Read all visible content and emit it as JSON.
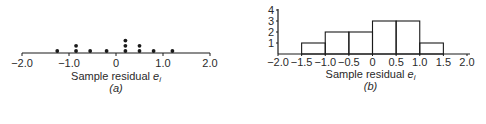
{
  "chart_data": [
    {
      "id": "a",
      "type": "scatter",
      "subtype": "dot-plot",
      "title": "",
      "xlabel": "Sample residual e_i",
      "xlabel_text": "Sample residual ",
      "xlabel_var": "e",
      "xlabel_sub": "i",
      "caption": "(a)",
      "xlim": [
        -2.0,
        2.0
      ],
      "xticks": [
        -2.0,
        -1.0,
        0,
        1.0,
        2.0
      ],
      "xtick_labels": [
        "−2.0",
        "−1.0",
        "0",
        "1.0",
        "2.0"
      ],
      "grid": false,
      "points": [
        {
          "x": -1.25,
          "count": 1
        },
        {
          "x": -0.85,
          "count": 2
        },
        {
          "x": -0.55,
          "count": 1
        },
        {
          "x": -0.2,
          "count": 1
        },
        {
          "x": 0.2,
          "count": 3
        },
        {
          "x": 0.5,
          "count": 2
        },
        {
          "x": 0.8,
          "count": 1
        },
        {
          "x": 1.2,
          "count": 1
        }
      ],
      "n": 12
    },
    {
      "id": "b",
      "type": "bar",
      "subtype": "histogram",
      "title": "",
      "xlabel": "Sample residual e_i",
      "xlabel_text": "Sample residual ",
      "xlabel_var": "e",
      "xlabel_sub": "i",
      "caption": "(b)",
      "ylabel": "",
      "xlim": [
        -2.0,
        2.0
      ],
      "ylim": [
        0,
        4
      ],
      "xticks": [
        -2.0,
        -1.5,
        -1.0,
        -0.5,
        0,
        0.5,
        1.0,
        1.5,
        2.0
      ],
      "xtick_labels": [
        "−2.0",
        "−1.5",
        "−1.0",
        "−0.5",
        "0",
        "0.5",
        "1.0",
        "1.5",
        "2.0"
      ],
      "yticks": [
        1,
        2,
        3,
        4
      ],
      "ytick_labels": [
        "1",
        "2",
        "3",
        "4"
      ],
      "grid": false,
      "bins": [
        {
          "from": -1.5,
          "to": -1.0,
          "count": 1
        },
        {
          "from": -1.0,
          "to": -0.5,
          "count": 2
        },
        {
          "from": -0.5,
          "to": 0.0,
          "count": 2
        },
        {
          "from": 0.0,
          "to": 0.5,
          "count": 3
        },
        {
          "from": 0.5,
          "to": 1.0,
          "count": 3
        },
        {
          "from": 1.0,
          "to": 1.5,
          "count": 1
        }
      ],
      "categories": [
        "-1.5 to -1.0",
        "-1.0 to -0.5",
        "-0.5 to 0",
        "0 to 0.5",
        "0.5 to 1.0",
        "1.0 to 1.5"
      ],
      "values": [
        1,
        2,
        2,
        3,
        3,
        1
      ]
    }
  ],
  "colors": {
    "ink": "#1a1a1a",
    "background": "#ffffff"
  }
}
